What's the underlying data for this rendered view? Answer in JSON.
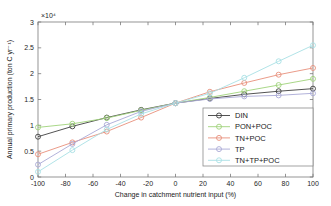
{
  "chart_data": {
    "type": "line",
    "title": "",
    "xlabel": "Change in catchment nutrient input (%)",
    "ylabel": "Annual primary production (ton C yr⁻¹)",
    "y_exponent_label": "×10⁴",
    "y_exponent_value": 10000,
    "xlim": [
      -100,
      100
    ],
    "ylim": [
      0,
      3
    ],
    "grid": false,
    "legend_position": "lower-right",
    "xticks": [
      -100,
      -80,
      -60,
      -40,
      -20,
      0,
      20,
      40,
      60,
      80,
      100
    ],
    "xticklabels": [
      "-100",
      "-80",
      "-60",
      "-40",
      "-20",
      "0",
      "20",
      "40",
      "60",
      "80",
      "100"
    ],
    "yticks": [
      0,
      0.5,
      1,
      1.5,
      2,
      2.5,
      3
    ],
    "yticklabels": [
      "0",
      "0.5",
      "1",
      "1.5",
      "2",
      "2.5",
      "3"
    ],
    "x": [
      -100,
      -75,
      -50,
      -25,
      0,
      25,
      50,
      75,
      100
    ],
    "series": [
      {
        "name": "DIN",
        "color": "#3f3f3f",
        "marker": "o",
        "values": [
          0.78,
          0.98,
          1.15,
          1.3,
          1.43,
          1.52,
          1.6,
          1.66,
          1.71
        ]
      },
      {
        "name": "PON+POC",
        "color": "#9fd27a",
        "marker": "o",
        "values": [
          0.96,
          1.03,
          1.14,
          1.29,
          1.43,
          1.54,
          1.66,
          1.78,
          1.9
        ]
      },
      {
        "name": "TN+POC",
        "color": "#e8907c",
        "marker": "o",
        "values": [
          0.44,
          0.67,
          0.88,
          1.15,
          1.43,
          1.65,
          1.82,
          1.98,
          2.11
        ]
      },
      {
        "name": "TP",
        "color": "#a9a9d6",
        "marker": "o",
        "values": [
          0.24,
          0.64,
          1.01,
          1.27,
          1.43,
          1.51,
          1.56,
          1.58,
          1.62
        ]
      },
      {
        "name": "TN+TP+POC",
        "color": "#a8e0e4",
        "marker": "o",
        "values": [
          0.1,
          0.52,
          0.92,
          1.22,
          1.43,
          1.62,
          1.92,
          2.24,
          2.55
        ]
      }
    ]
  }
}
